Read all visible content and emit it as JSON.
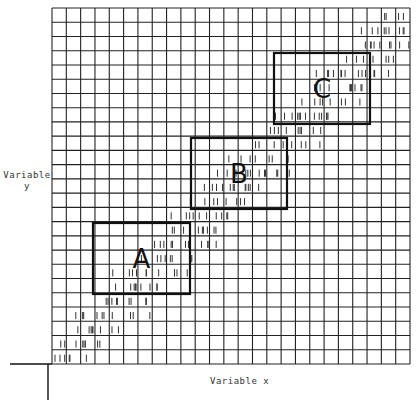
{
  "diagram": {
    "x_axis_label": "Variable x",
    "y_axis_label_line1": "Variable",
    "y_axis_label_line2": "y",
    "grid": {
      "left": 52,
      "top": 8,
      "right": 410,
      "bottom": 364,
      "cols": 25,
      "rows": 25
    },
    "boxes": [
      {
        "label": "A",
        "x1": 93,
        "y1": 223,
        "x2": 190,
        "y2": 294
      },
      {
        "label": "B",
        "x1": 191,
        "y1": 138,
        "x2": 287,
        "y2": 209
      },
      {
        "label": "C",
        "x1": 274,
        "y1": 53,
        "x2": 370,
        "y2": 124
      }
    ],
    "scatter_band": "diagonal band of tally marks from lower-left to upper-right",
    "colors": {
      "grid": "#222222",
      "box": "#111111",
      "tally": "#333333"
    }
  }
}
